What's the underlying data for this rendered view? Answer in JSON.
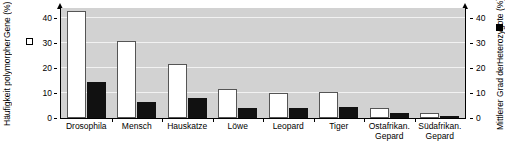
{
  "chart_data": {
    "type": "bar",
    "title": "",
    "categories": [
      "Drosophila",
      "Mensch",
      "Hauskatze",
      "Löwe",
      "Leopard",
      "Tiger",
      "Ostafrikan. Gepard",
      "Südafrikan. Gepard"
    ],
    "category_lines": [
      [
        "Drosophila",
        ""
      ],
      [
        "Mensch",
        ""
      ],
      [
        "Hauskatze",
        ""
      ],
      [
        "Löwe",
        ""
      ],
      [
        "Leopard",
        ""
      ],
      [
        "Tiger",
        ""
      ],
      [
        "Ostafrikan.",
        "Gepard"
      ],
      [
        "Südafrikan.",
        "Gepard"
      ]
    ],
    "series": [
      {
        "name": "Häufigkeit polymorpher Gene (%)",
        "axis": "left",
        "color": "#ffffff",
        "swatch": "white",
        "values": [
          43,
          31,
          21.5,
          11.5,
          10,
          10.5,
          4,
          2
        ]
      },
      {
        "name": "Mittlerer Grad der Heterozygote (%)",
        "axis": "right",
        "color": "#111111",
        "swatch": "black",
        "values": [
          14.5,
          6.5,
          8,
          4,
          4,
          4.5,
          2,
          0.6
        ]
      }
    ],
    "xlabel": "",
    "ylabel_left": "Häufigkeit polymorpher Gene (%)",
    "ylabel_left_lines": [
      "Häufigkeit polymorpher",
      "Gene (%)"
    ],
    "ylabel_right": "Mittlerer Grad der Heterozygote (%)",
    "ylabel_right_lines": [
      "Mittlerer Grad der",
      "Heterozygote (%)"
    ],
    "ylim_left": [
      0,
      44
    ],
    "ylim_right": [
      0,
      44
    ],
    "yticks_left": [
      0,
      10,
      20,
      30,
      40
    ],
    "yticks_right": [
      0,
      10,
      20,
      30,
      40
    ],
    "ytick_labels_left": [
      "0",
      "10",
      "20",
      "30",
      "40"
    ],
    "ytick_labels_right": [
      "0",
      "10",
      "20",
      "30",
      "40"
    ],
    "grid": true,
    "grid_color": "#f2f2f2",
    "plot_background": "#d2d2d2",
    "legend_position": "axis-titles"
  }
}
